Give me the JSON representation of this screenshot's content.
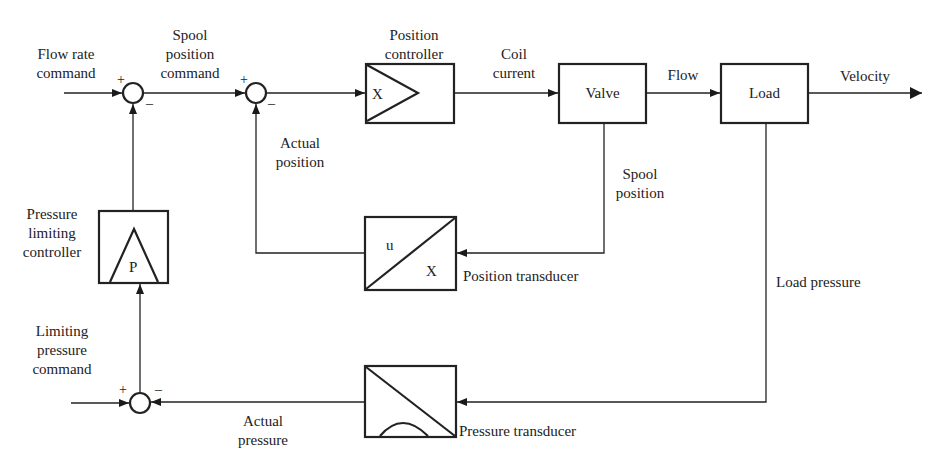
{
  "diagram": {
    "type": "block-diagram",
    "blocks": {
      "position_controller": {
        "label": "Position controller",
        "symbol": "X"
      },
      "valve": {
        "label": "Valve"
      },
      "load": {
        "label": "Load"
      },
      "position_transducer": {
        "label": "Position transducer",
        "symbol_top": "u",
        "symbol_bottom": "X"
      },
      "pressure_transducer": {
        "label": "Pressure transducer"
      },
      "pressure_limiting_controller": {
        "label_lines": [
          "Pressure",
          "limiting",
          "controller"
        ],
        "symbol": "P"
      }
    },
    "signals": {
      "flow_rate_command": [
        "Flow rate",
        "command"
      ],
      "spool_position_command": [
        "Spool",
        "position",
        "command"
      ],
      "coil_current": [
        "Coil",
        "current"
      ],
      "flow": "Flow",
      "velocity": "Velocity",
      "actual_position": [
        "Actual",
        "position"
      ],
      "spool_position": [
        "Spool",
        "position"
      ],
      "load_pressure": "Load pressure",
      "limiting_pressure_command": [
        "Limiting",
        "pressure",
        "command"
      ],
      "actual_pressure": [
        "Actual",
        "pressure"
      ]
    },
    "junctions": {
      "plus": "+",
      "minus": "–"
    },
    "position_controller_title": [
      "Position",
      "controller"
    ]
  }
}
